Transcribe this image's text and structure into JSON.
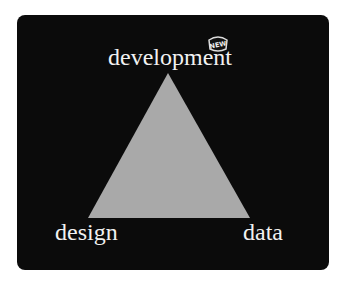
{
  "diagram": {
    "type": "triangle",
    "vertices": {
      "top": "development",
      "bottom_left": "design",
      "bottom_right": "data"
    },
    "badge": "NEW",
    "colors": {
      "background": "#0b0b0b",
      "triangle_fill": "#a9a9a9",
      "label_text": "#f2f2f2"
    }
  }
}
